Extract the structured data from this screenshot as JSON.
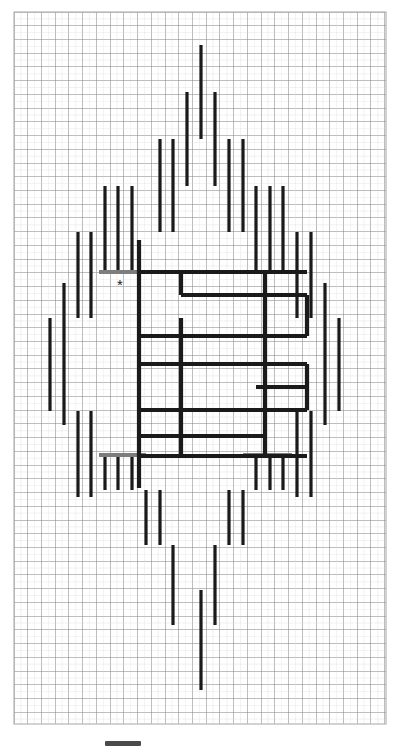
{
  "figure": {
    "title": "",
    "marker_label": "*",
    "grid": {
      "x0": 14,
      "y0": 12,
      "x1": 386,
      "y1": 724,
      "cell": 13.73,
      "minor_color": "#cfcfcf",
      "major_color": "#8a8a8a",
      "major_every": 1,
      "border_color": "#b5b5b5"
    },
    "stroke_color": "#1a1a1a",
    "bar_width": 3.2,
    "scalebar": {
      "x": 105,
      "y": 741,
      "length": 36,
      "thickness": 5,
      "color": "#4a4a4a",
      "label": ""
    },
    "marker": {
      "x": 120,
      "y": 290,
      "glyph": "*"
    }
  },
  "chart_data": {
    "type": "scatter",
    "title": "",
    "xlabel": "",
    "ylabel": "",
    "xlim": [
      14,
      386
    ],
    "ylim": [
      12,
      724
    ],
    "grid": true,
    "legend": "none",
    "annotations": [
      {
        "text": "*",
        "x": 120,
        "y": 290
      }
    ],
    "vertical_bars": [
      {
        "x": 201,
        "y1": 45,
        "y2": 139
      },
      {
        "x": 187,
        "y1": 92,
        "y2": 186
      },
      {
        "x": 215,
        "y1": 92,
        "y2": 186
      },
      {
        "x": 160,
        "y1": 139,
        "y2": 232
      },
      {
        "x": 173,
        "y1": 139,
        "y2": 232
      },
      {
        "x": 229,
        "y1": 139,
        "y2": 232
      },
      {
        "x": 243,
        "y1": 139,
        "y2": 232
      },
      {
        "x": 118,
        "y1": 186,
        "y2": 272
      },
      {
        "x": 132,
        "y1": 186,
        "y2": 272
      },
      {
        "x": 105,
        "y1": 186,
        "y2": 272
      },
      {
        "x": 256,
        "y1": 186,
        "y2": 272
      },
      {
        "x": 270,
        "y1": 186,
        "y2": 272
      },
      {
        "x": 283,
        "y1": 186,
        "y2": 272
      },
      {
        "x": 78,
        "y1": 232,
        "y2": 318
      },
      {
        "x": 91,
        "y1": 232,
        "y2": 318
      },
      {
        "x": 297,
        "y1": 232,
        "y2": 318
      },
      {
        "x": 311,
        "y1": 232,
        "y2": 318
      },
      {
        "x": 50,
        "y1": 318,
        "y2": 411
      },
      {
        "x": 64,
        "y1": 283,
        "y2": 425
      },
      {
        "x": 325,
        "y1": 283,
        "y2": 425
      },
      {
        "x": 339,
        "y1": 318,
        "y2": 411
      },
      {
        "x": 78,
        "y1": 411,
        "y2": 497
      },
      {
        "x": 91,
        "y1": 411,
        "y2": 497
      },
      {
        "x": 297,
        "y1": 411,
        "y2": 497
      },
      {
        "x": 311,
        "y1": 411,
        "y2": 497
      },
      {
        "x": 105,
        "y1": 456,
        "y2": 490
      },
      {
        "x": 118,
        "y1": 456,
        "y2": 490
      },
      {
        "x": 132,
        "y1": 456,
        "y2": 490
      },
      {
        "x": 256,
        "y1": 456,
        "y2": 490
      },
      {
        "x": 270,
        "y1": 456,
        "y2": 490
      },
      {
        "x": 283,
        "y1": 456,
        "y2": 490
      },
      {
        "x": 146,
        "y1": 490,
        "y2": 545
      },
      {
        "x": 160,
        "y1": 490,
        "y2": 545
      },
      {
        "x": 229,
        "y1": 490,
        "y2": 545
      },
      {
        "x": 243,
        "y1": 490,
        "y2": 545
      },
      {
        "x": 173,
        "y1": 545,
        "y2": 625
      },
      {
        "x": 215,
        "y1": 545,
        "y2": 625
      },
      {
        "x": 201,
        "y1": 590,
        "y2": 690
      }
    ],
    "horizontal_bars": [
      {
        "y": 272,
        "x1": 99,
        "x2": 146,
        "color": "#7d7d7d",
        "thickness": 4
      },
      {
        "y": 272,
        "x1": 243,
        "x2": 292,
        "color": "#7d7d7d",
        "thickness": 4
      },
      {
        "y": 455,
        "x1": 99,
        "x2": 146,
        "color": "#7d7d7d",
        "thickness": 4
      },
      {
        "y": 455,
        "x1": 243,
        "x2": 292,
        "color": "#7d7d7d",
        "thickness": 4
      }
    ],
    "central_rectangles": [
      {
        "x": 139,
        "y": 272,
        "w": 126,
        "h": 46
      },
      {
        "x": 139,
        "y": 318,
        "w": 126,
        "h": 46
      },
      {
        "x": 139,
        "y": 364,
        "w": 126,
        "h": 46
      },
      {
        "x": 139,
        "y": 410,
        "w": 126,
        "h": 46
      },
      {
        "x": 181,
        "y": 272,
        "w": 84,
        "h": 23
      },
      {
        "x": 181,
        "y": 295,
        "w": 126,
        "h": 41
      },
      {
        "x": 181,
        "y": 364,
        "w": 126,
        "h": 46
      },
      {
        "x": 256,
        "y": 387,
        "w": 51,
        "h": 23
      }
    ],
    "central_verticals": [
      {
        "x": 139,
        "y1": 272,
        "y2": 456
      },
      {
        "x": 181,
        "y1": 272,
        "y2": 295
      },
      {
        "x": 181,
        "y1": 364,
        "y2": 456
      },
      {
        "x": 265,
        "y1": 272,
        "y2": 456
      },
      {
        "x": 307,
        "y1": 295,
        "y2": 336
      },
      {
        "x": 307,
        "y1": 364,
        "y2": 410
      },
      {
        "x": 181,
        "y1": 318,
        "y2": 364
      },
      {
        "x": 139,
        "y1": 240,
        "y2": 272
      },
      {
        "x": 139,
        "y1": 456,
        "y2": 488
      }
    ],
    "central_horizontals": [
      {
        "y": 272,
        "x1": 139,
        "x2": 307
      },
      {
        "y": 295,
        "x1": 181,
        "x2": 307
      },
      {
        "y": 336,
        "x1": 139,
        "x2": 307
      },
      {
        "y": 364,
        "x1": 139,
        "x2": 307
      },
      {
        "y": 387,
        "x1": 256,
        "x2": 307
      },
      {
        "y": 410,
        "x1": 139,
        "x2": 307
      },
      {
        "y": 436,
        "x1": 139,
        "x2": 265
      },
      {
        "y": 456,
        "x1": 139,
        "x2": 307
      }
    ]
  }
}
